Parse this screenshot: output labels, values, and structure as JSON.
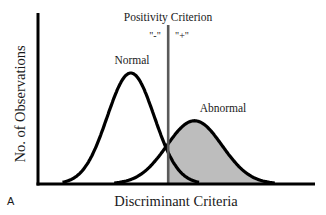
{
  "figure": {
    "panel_label": "A",
    "criterion_label": "Positivity Criterion",
    "negative_label": "\"-\"",
    "positive_label": "\"+\"",
    "normal_label": "Normal",
    "abnormal_label": "Abnormal",
    "x_axis_label": "Discriminant Criteria",
    "y_axis_label": "No. of Observations"
  },
  "distributions": {
    "normal": {
      "mean": 0.335,
      "sd": 0.085,
      "relative_height": 1.0
    },
    "abnormal": {
      "mean": 0.565,
      "sd": 0.1,
      "relative_height": 0.57
    },
    "criterion_x": 0.47
  },
  "colors": {
    "curve": "#000000",
    "axis": "#000000",
    "criterion_line": "#5a5a5a",
    "shade": "#bdbdbd"
  }
}
